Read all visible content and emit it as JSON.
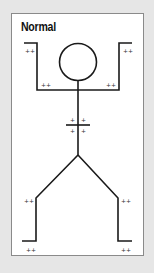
{
  "panel": {
    "title": "Normal"
  },
  "figure": {
    "reflex_marks": {
      "left_hand": "++",
      "right_hand": "++",
      "left_elbow": "++",
      "right_elbow": "++",
      "abdomen_upper_left": "+",
      "abdomen_upper_right": "+",
      "abdomen_lower_left": "+",
      "abdomen_lower_right": "+",
      "left_knee": "++",
      "right_knee": "++",
      "left_ankle": "++",
      "right_ankle": "++"
    }
  },
  "colors": {
    "background": "#e6e6e6",
    "panel": "#ffffff",
    "border": "#8a8a8a",
    "line": "#1a1a1a"
  }
}
